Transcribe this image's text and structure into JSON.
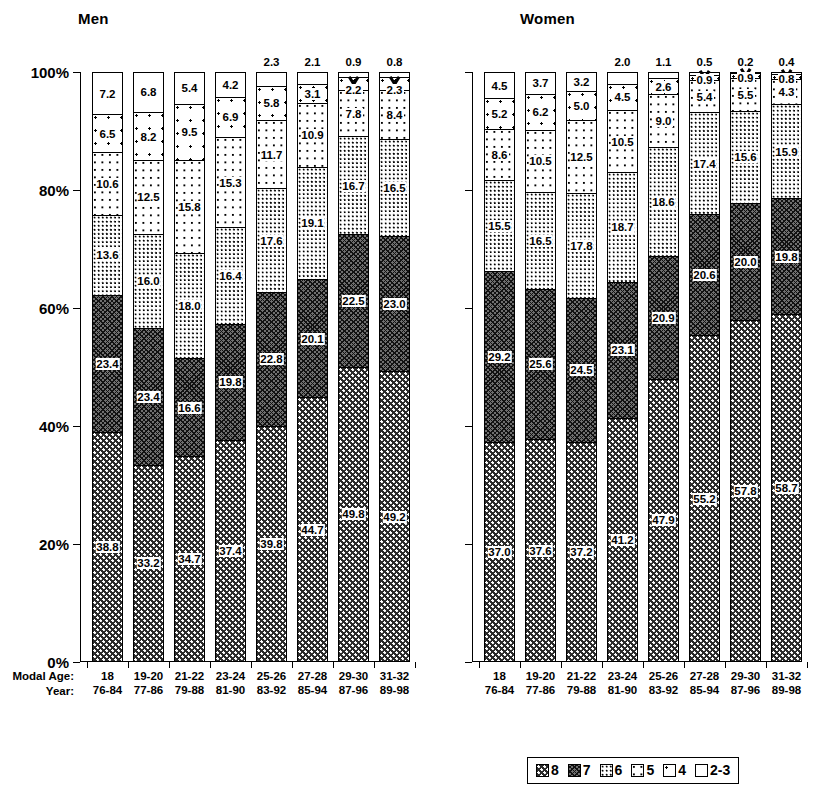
{
  "panels": [
    {
      "key": "men",
      "title": "Men"
    },
    {
      "key": "women",
      "title": "Women"
    }
  ],
  "axis": {
    "y_ticks": [
      "100%",
      "80%",
      "60%",
      "40%",
      "20%",
      "0%"
    ],
    "row_label_modal_age": "Modal Age:",
    "row_label_year": "Year:"
  },
  "legend": {
    "items": [
      {
        "label": "8",
        "fill": "f8"
      },
      {
        "label": "7",
        "fill": "f7"
      },
      {
        "label": "6",
        "fill": "f6"
      },
      {
        "label": "5",
        "fill": "f5"
      },
      {
        "label": "4",
        "fill": "f4"
      },
      {
        "label": "2-3",
        "fill": "f23"
      }
    ]
  },
  "chart_data": {
    "type": "bar",
    "subtype": "stacked-percent",
    "title": "",
    "xlabel": "",
    "ylabel": "",
    "ylim": [
      0,
      100
    ],
    "ytick_labels": [
      "0%",
      "20%",
      "40%",
      "60%",
      "80%",
      "100%"
    ],
    "grid": false,
    "legend_position": "bottom-right",
    "legend_entries": [
      "8",
      "7",
      "6",
      "5",
      "4",
      "2-3"
    ],
    "categories": [
      "18",
      "19-20",
      "21-22",
      "23-24",
      "25-26",
      "27-28",
      "29-30",
      "31-32"
    ],
    "secondary_categories": [
      "76-84",
      "77-86",
      "79-88",
      "81-90",
      "83-92",
      "85-94",
      "87-96",
      "89-98"
    ],
    "panels": [
      {
        "name": "Men",
        "series": [
          {
            "name": "8",
            "values": [
              38.8,
              33.2,
              34.7,
              37.4,
              39.8,
              44.7,
              49.8,
              49.2
            ]
          },
          {
            "name": "7",
            "values": [
              23.4,
              23.4,
              16.6,
              19.8,
              22.8,
              20.1,
              22.5,
              23.0
            ]
          },
          {
            "name": "6",
            "values": [
              13.6,
              16.0,
              18.0,
              16.4,
              17.6,
              19.1,
              16.7,
              16.5
            ]
          },
          {
            "name": "5",
            "values": [
              10.6,
              12.5,
              15.8,
              15.3,
              11.7,
              10.9,
              7.8,
              8.4
            ]
          },
          {
            "name": "4",
            "values": [
              6.5,
              8.2,
              9.5,
              6.9,
              5.8,
              3.1,
              2.2,
              2.3
            ]
          },
          {
            "name": "2-3",
            "values": [
              7.2,
              6.8,
              5.4,
              4.2,
              2.3,
              2.1,
              0.9,
              0.8
            ]
          }
        ]
      },
      {
        "name": "Women",
        "series": [
          {
            "name": "8",
            "values": [
              37.0,
              37.6,
              37.2,
              41.2,
              47.9,
              55.2,
              57.8,
              58.7
            ]
          },
          {
            "name": "7",
            "values": [
              29.2,
              25.6,
              24.5,
              23.1,
              20.9,
              20.6,
              20.0,
              19.8
            ]
          },
          {
            "name": "6",
            "values": [
              15.5,
              16.5,
              17.8,
              18.7,
              18.6,
              17.4,
              15.6,
              15.9
            ]
          },
          {
            "name": "5",
            "values": [
              8.6,
              10.5,
              12.5,
              10.5,
              9.0,
              5.4,
              5.5,
              4.3
            ]
          },
          {
            "name": "4",
            "values": [
              5.2,
              6.2,
              5.0,
              4.5,
              2.6,
              0.9,
              0.9,
              0.8
            ]
          },
          {
            "name": "2-3",
            "values": [
              4.5,
              3.7,
              3.2,
              2.0,
              1.1,
              0.5,
              0.2,
              0.4
            ]
          }
        ]
      }
    ]
  }
}
